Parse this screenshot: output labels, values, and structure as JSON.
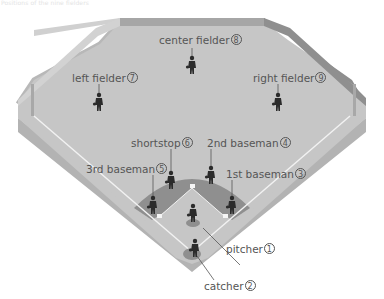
{
  "caption": "Positions of the nine fielders",
  "colors": {
    "outfield": "#c4c4c4",
    "wall": "#9a9a9a",
    "wall_side": "#b0b0b0",
    "infield_dirt": "#8c8c8c",
    "lines": "#f2f2f2",
    "player": "#2b2b2b",
    "label": "#555555"
  },
  "players": [
    {
      "id": "pitcher",
      "label": "pitcher",
      "number": "1"
    },
    {
      "id": "catcher",
      "label": "catcher",
      "number": "2"
    },
    {
      "id": "first-baseman",
      "label": "1st baseman",
      "number": "3"
    },
    {
      "id": "second-baseman",
      "label": "2nd baseman",
      "number": "4"
    },
    {
      "id": "third-baseman",
      "label": "3rd baseman",
      "number": "5"
    },
    {
      "id": "shortstop",
      "label": "shortstop",
      "number": "6"
    },
    {
      "id": "left-fielder",
      "label": "left fielder",
      "number": "7"
    },
    {
      "id": "center-fielder",
      "label": "center fielder",
      "number": "8"
    },
    {
      "id": "right-fielder",
      "label": "right fielder",
      "number": "9"
    }
  ]
}
